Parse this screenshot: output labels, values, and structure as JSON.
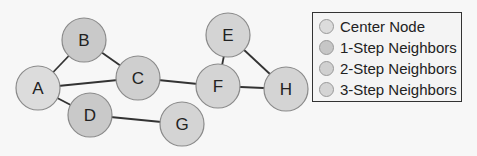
{
  "diagram": {
    "nodes": [
      {
        "id": "A",
        "label": "A",
        "x": 38,
        "y": 88,
        "level": "center",
        "fill": "#dcdcdc"
      },
      {
        "id": "B",
        "label": "B",
        "x": 84,
        "y": 40,
        "level": "1-step",
        "fill": "#c9c9c9"
      },
      {
        "id": "C",
        "label": "C",
        "x": 138,
        "y": 78,
        "level": "1-step",
        "fill": "#cfcfcf"
      },
      {
        "id": "D",
        "label": "D",
        "x": 90,
        "y": 115,
        "level": "1-step",
        "fill": "#c9c9c9"
      },
      {
        "id": "E",
        "label": "E",
        "x": 228,
        "y": 35,
        "level": "3-step",
        "fill": "#d4d4d4"
      },
      {
        "id": "F",
        "label": "F",
        "x": 218,
        "y": 86,
        "level": "2-step",
        "fill": "#d4d4d4"
      },
      {
        "id": "G",
        "label": "G",
        "x": 182,
        "y": 124,
        "level": "2-step",
        "fill": "#d4d4d4"
      },
      {
        "id": "H",
        "label": "H",
        "x": 286,
        "y": 89,
        "level": "3-step",
        "fill": "#d4d4d4"
      }
    ],
    "edges": [
      [
        "A",
        "B"
      ],
      [
        "A",
        "C"
      ],
      [
        "A",
        "D"
      ],
      [
        "B",
        "C"
      ],
      [
        "C",
        "F"
      ],
      [
        "D",
        "G"
      ],
      [
        "E",
        "F"
      ],
      [
        "E",
        "H"
      ],
      [
        "F",
        "H"
      ]
    ],
    "node_radius": 22,
    "edge_color": "#333333",
    "node_stroke": "#8a8a8a"
  },
  "legend": {
    "items": [
      {
        "label": "Center Node",
        "color": "#dcdcdc"
      },
      {
        "label": "1-Step Neighbors",
        "color": "#c6c6c6"
      },
      {
        "label": "2-Step Neighbors",
        "color": "#d0d0d0"
      },
      {
        "label": "3-Step Neighbors",
        "color": "#d4d4d4"
      }
    ]
  }
}
